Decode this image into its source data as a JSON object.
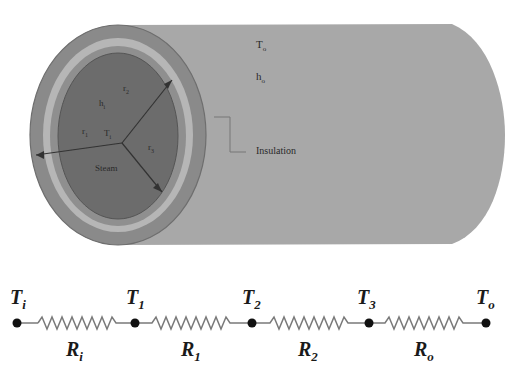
{
  "diagram": {
    "pipe": {
      "outer_labels": {
        "ambient_temp": "T",
        "ambient_temp_sub": "o",
        "ambient_h": "h",
        "ambient_h_sub": "o"
      },
      "insulation_label": "Insulation",
      "inner_labels": {
        "h_inner": "h",
        "h_inner_sub": "i",
        "r2": "r",
        "r2_sub": "2",
        "r1": "r",
        "r1_sub": "1",
        "t_inner": "T",
        "t_inner_sub": "i",
        "r3": "r",
        "r3_sub": "3",
        "fluid": "Steam"
      },
      "colors": {
        "cylinder": "#a8a8a8",
        "outer_ring": "#8a8a8a",
        "insulation_ring": "#b6b6b6",
        "pipe_wall": "#8f8f8f",
        "core": "#6c6c6c"
      }
    },
    "network": {
      "nodes": [
        {
          "label": "T",
          "sub": "i"
        },
        {
          "label": "T",
          "sub": "1"
        },
        {
          "label": "T",
          "sub": "2"
        },
        {
          "label": "T",
          "sub": "3"
        },
        {
          "label": "T",
          "sub": "o"
        }
      ],
      "resistors": [
        {
          "label": "R",
          "sub": "i"
        },
        {
          "label": "R",
          "sub": "1"
        },
        {
          "label": "R",
          "sub": "2"
        },
        {
          "label": "R",
          "sub": "o"
        }
      ],
      "colors": {
        "wire": "#7a7a7a",
        "node": "#111111"
      }
    }
  }
}
